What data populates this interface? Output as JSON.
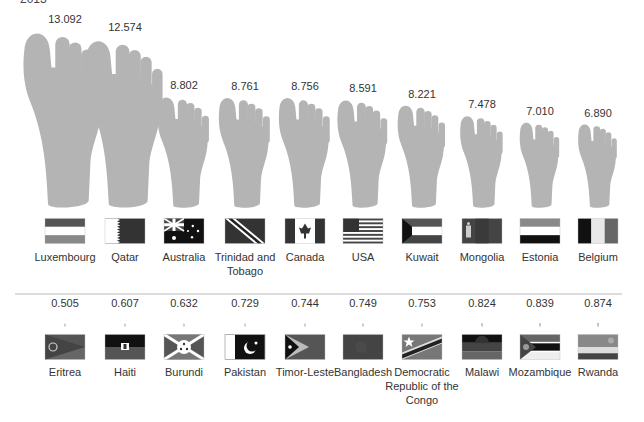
{
  "header": {
    "year": "2013"
  },
  "chart_data": {
    "type": "pictogram-bar",
    "title": "",
    "subtitle": "2013",
    "unit_icon": "foot-icon",
    "groups": [
      {
        "name": "Highest",
        "categories": [
          "Luxembourg",
          "Qatar",
          "Australia",
          "Trinidad and Tobago",
          "Canada",
          "USA",
          "Kuwait",
          "Mongolia",
          "Estonia",
          "Belgium"
        ],
        "values": [
          13.092,
          12.574,
          8.802,
          8.761,
          8.756,
          8.591,
          8.221,
          7.478,
          7.01,
          6.89
        ],
        "labels": [
          "13.092",
          "12.574",
          "8.802",
          "8.761",
          "8.756",
          "8.591",
          "8.221",
          "7.478",
          "7.010",
          "6.890"
        ]
      },
      {
        "name": "Lowest",
        "categories": [
          "Eritrea",
          "Haiti",
          "Burundi",
          "Pakistan",
          "Timor-Leste",
          "Bangladesh",
          "Democratic Republic of the Congo",
          "Malawi",
          "Mozambique",
          "Rwanda"
        ],
        "values": [
          0.505,
          0.607,
          0.632,
          0.729,
          0.744,
          0.749,
          0.753,
          0.824,
          0.839,
          0.874
        ],
        "labels": [
          "0.505",
          "0.607",
          "0.632",
          "0.729",
          "0.744",
          "0.749",
          "0.753",
          "0.824",
          "0.839",
          "0.874"
        ]
      }
    ],
    "colors": {
      "foot": "#b4b4b4",
      "divider": "#dcdcdc",
      "text": "#333333"
    }
  },
  "flags": {
    "top": [
      "luxembourg-flag",
      "qatar-flag",
      "australia-flag",
      "trinidad-flag",
      "canada-flag",
      "usa-flag",
      "kuwait-flag",
      "mongolia-flag",
      "estonia-flag",
      "belgium-flag"
    ],
    "bottom": [
      "eritrea-flag",
      "haiti-flag",
      "burundi-flag",
      "pakistan-flag",
      "timor-leste-flag",
      "bangladesh-flag",
      "drc-flag",
      "malawi-flag",
      "mozambique-flag",
      "rwanda-flag"
    ]
  }
}
